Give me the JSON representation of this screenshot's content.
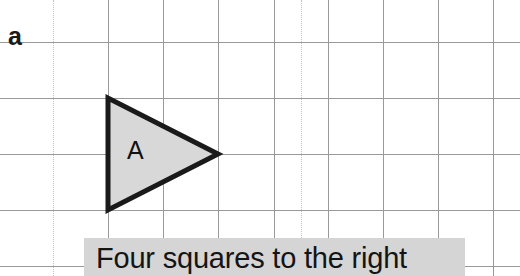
{
  "figure": {
    "panel_label": "a",
    "caption": "Four squares to the right",
    "shape_label": "A",
    "colors": {
      "shape_fill": "#d8d8d8",
      "shape_stroke": "#1a1a1a",
      "grid_line": "#9a9a9a",
      "grid_line_faint": "#c2c2c2",
      "caption_band": "#d5d5d5",
      "text": "#141414",
      "background": "#ffffff"
    }
  },
  "grid": {
    "spacing": 55,
    "vertical_solid_x": [
      108,
      163,
      218,
      274,
      328,
      383,
      438,
      493
    ],
    "vertical_faint_x": [
      53,
      301
    ],
    "horizontal_solid_y": [
      42,
      98,
      154,
      210,
      266
    ],
    "horizontal_faint_y": []
  },
  "shape": {
    "type": "triangle",
    "direction": "right",
    "points": "108,98 108,210 218,154",
    "width_cells": 2,
    "height_cells": 2
  }
}
